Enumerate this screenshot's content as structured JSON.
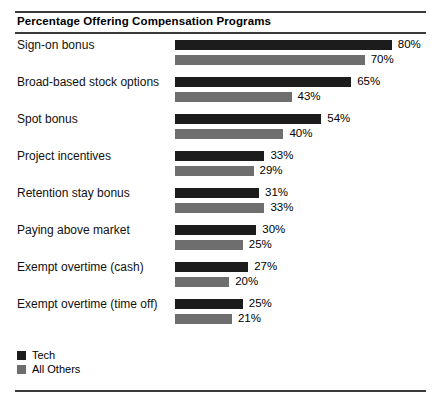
{
  "chart_data": {
    "type": "bar",
    "title": "Percentage Offering Compensation Programs",
    "xlabel": "",
    "ylabel": "",
    "orientation": "horizontal",
    "grid": false,
    "legend_position": "bottom-left",
    "xlim": [
      0,
      80
    ],
    "value_suffix": "%",
    "categories": [
      "Sign-on bonus",
      "Broad-based stock options",
      "Spot bonus",
      "Project incentives",
      "Retention stay bonus",
      "Paying above market",
      "Exempt overtime (cash)",
      "Exempt overtime (time off)"
    ],
    "series": [
      {
        "name": "Tech",
        "color": "#1c1c1c",
        "values": [
          80,
          65,
          54,
          33,
          31,
          30,
          27,
          25
        ],
        "labels": [
          "80%",
          "65%",
          "54%",
          "33%",
          "31%",
          "30%",
          "27%",
          "25%"
        ]
      },
      {
        "name": "All Others",
        "color": "#6e6e6e",
        "values": [
          70,
          43,
          40,
          29,
          33,
          25,
          20,
          21
        ],
        "labels": [
          "70%",
          "43%",
          "40%",
          "29%",
          "33%",
          "25%",
          "20%",
          "21%"
        ]
      }
    ]
  },
  "legend": {
    "items": [
      {
        "label": "Tech",
        "color": "#1c1c1c"
      },
      {
        "label": "All Others",
        "color": "#6e6e6e"
      }
    ]
  }
}
